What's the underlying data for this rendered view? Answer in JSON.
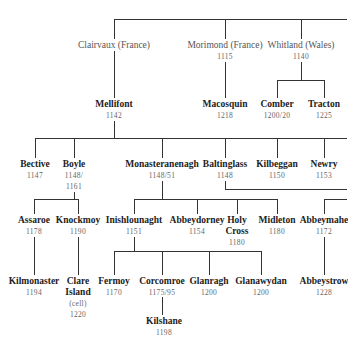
{
  "diagram": {
    "type": "genealogy-tree",
    "nodes": {
      "clairvaux": {
        "name": "Clairvaux (France)",
        "date": ""
      },
      "morimond": {
        "name": "Morimond (France)",
        "date": "1115"
      },
      "whitland": {
        "name": "Whitland (Wales)",
        "date": "1140"
      },
      "mellifont": {
        "name": "Mellifont",
        "date": "1142"
      },
      "macosquin": {
        "name": "Macosquin",
        "date": "1218"
      },
      "comber": {
        "name": "Comber",
        "date": "1200/20"
      },
      "tracton": {
        "name": "Tracton",
        "date": "1225"
      },
      "bective": {
        "name": "Bective",
        "date": "1147"
      },
      "boyle": {
        "name": "Boyle",
        "date": "1148/",
        "date2": "1161"
      },
      "monasteranenagh": {
        "name": "Monasteranenagh",
        "date": "1148/51"
      },
      "baltinglass": {
        "name": "Baltinglass",
        "date": "1148"
      },
      "kilbeggan": {
        "name": "Kilbeggan",
        "date": "1150"
      },
      "newry": {
        "name": "Newry",
        "date": "1153"
      },
      "assaroe": {
        "name": "Assaroe",
        "date": "1178"
      },
      "knockmoy": {
        "name": "Knockmoy",
        "date": "1190"
      },
      "inishlounaght": {
        "name": "Inishlounaght",
        "date": "1151"
      },
      "abbeydorney": {
        "name": "Abbeydorney",
        "date": "1154"
      },
      "holycross": {
        "name": "Holy",
        "name2": "Cross",
        "date": "1180"
      },
      "midleton": {
        "name": "Midleton",
        "date": "1180"
      },
      "abbeymahon": {
        "name": "Abbeymahe",
        "date": "1172"
      },
      "kilmonaster": {
        "name": "Kilmonaster",
        "date": "1194"
      },
      "clareisland": {
        "name": "Clare",
        "name2": "Island",
        "note": "(cell)",
        "date": "1220"
      },
      "fermoy": {
        "name": "Fermoy",
        "date": "1170"
      },
      "corcomroe": {
        "name": "Corcomroe",
        "date": "1175/95"
      },
      "glanragh": {
        "name": "Glanragh",
        "date": "1200"
      },
      "glanawydan": {
        "name": "Glanawydan",
        "date": "1200"
      },
      "abbeystrowry": {
        "name": "Abbeystrow",
        "date": "1228"
      },
      "kilshane": {
        "name": "Kilshane",
        "date": "1198"
      }
    }
  }
}
